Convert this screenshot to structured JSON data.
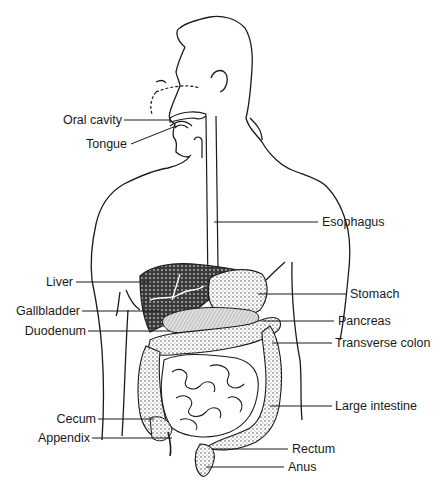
{
  "diagram": {
    "type": "labeled-anatomy",
    "line_color": "#1a1a1a",
    "fill_dark": "#2a2a2a",
    "fill_mid": "#9a9a9a",
    "fill_light": "#d6d6d6",
    "labels_left": [
      {
        "id": "oral-cavity",
        "text": "Oral cavity"
      },
      {
        "id": "tongue",
        "text": "Tongue"
      },
      {
        "id": "liver",
        "text": "Liver"
      },
      {
        "id": "gallbladder",
        "text": "Gallbladder"
      },
      {
        "id": "duodenum",
        "text": "Duodenum"
      },
      {
        "id": "cecum",
        "text": "Cecum"
      },
      {
        "id": "appendix",
        "text": "Appendix"
      }
    ],
    "labels_right": [
      {
        "id": "esophagus",
        "text": "Esophagus"
      },
      {
        "id": "stomach",
        "text": "Stomach"
      },
      {
        "id": "pancreas",
        "text": "Pancreas"
      },
      {
        "id": "transverse-colon",
        "text": "Transverse colon"
      },
      {
        "id": "large-intestine",
        "text": "Large intestine"
      },
      {
        "id": "rectum",
        "text": "Rectum"
      },
      {
        "id": "anus",
        "text": "Anus"
      }
    ]
  }
}
